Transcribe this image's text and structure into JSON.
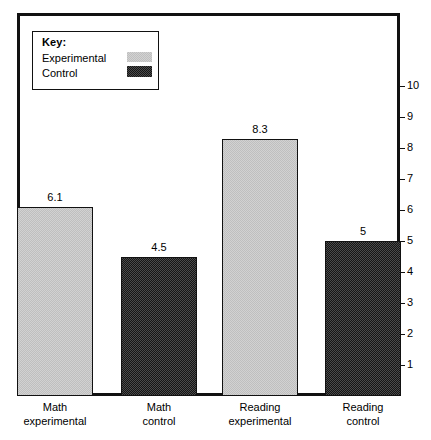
{
  "chart_data": {
    "type": "bar",
    "title": "",
    "xlabel": "",
    "ylabel": "",
    "ylim": [
      0,
      10
    ],
    "grid": false,
    "legend_position": "top-left",
    "categories": [
      "Math experimental",
      "Math control",
      "Reading experimental",
      "Reading control"
    ],
    "category_lines": [
      {
        "line1": "Math",
        "line2": "experimental"
      },
      {
        "line1": "Math",
        "line2": "control"
      },
      {
        "line1": "Reading",
        "line2": "experimental"
      },
      {
        "line1": "Reading",
        "line2": "control"
      }
    ],
    "values": [
      6.1,
      4.5,
      8.3,
      5
    ],
    "value_labels": [
      "6.1",
      "4.5",
      "8.3",
      "5"
    ],
    "series": [
      {
        "name": "Experimental",
        "values": [
          6.1,
          null,
          8.3,
          null
        ]
      },
      {
        "name": "Control",
        "values": [
          null,
          4.5,
          null,
          5
        ]
      }
    ],
    "bar_group": [
      "Experimental",
      "Control",
      "Experimental",
      "Control"
    ],
    "y_ticks": [
      "1",
      "2",
      "3",
      "4",
      "5",
      "6",
      "7",
      "8",
      "9",
      "10"
    ],
    "colors": {
      "experimental_fill": "#d2d2d2",
      "control_fill": "#4a4a4a",
      "outline": "#111111",
      "background": "#ffffff"
    }
  },
  "legend": {
    "title": "Key:",
    "entries": [
      {
        "label": "Experimental",
        "swatch": "light-checker-swatch"
      },
      {
        "label": "Control",
        "swatch": "dark-checker-swatch"
      }
    ]
  }
}
